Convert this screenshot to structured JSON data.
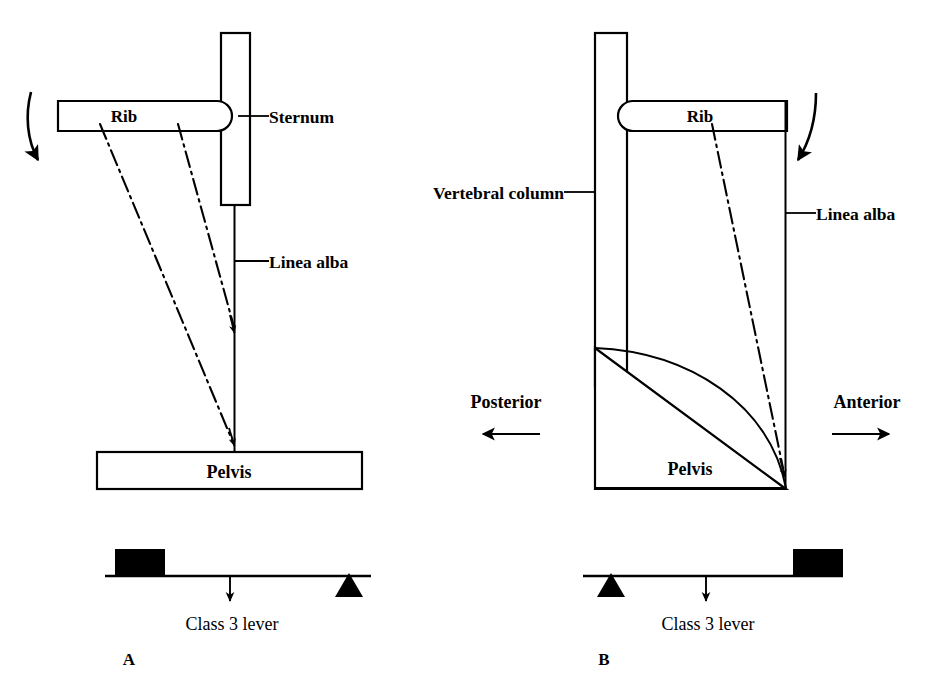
{
  "figure": {
    "kind": "anatomical-lever-diagram",
    "background_color": "#ffffff",
    "ink_color": "#000000"
  },
  "panel_a": {
    "panel_letter": "A",
    "rib_label": "Rib",
    "sternum_label": "Sternum",
    "linea_alba_label": "Linea alba",
    "pelvis_label": "Pelvis",
    "lever_label": "Class 3 lever",
    "lever_class": "Class 3",
    "rotation_arrow": "curved-down-arrow-left",
    "muscle_line_count": 2,
    "lever_effort_position": "left",
    "lever_fulcrum_position": "right",
    "lever_load_position": "center"
  },
  "panel_b": {
    "panel_letter": "B",
    "rib_label": "Rib",
    "vertebral_column_label": "Vertebral column",
    "linea_alba_label": "Linea alba",
    "pelvis_label": "Pelvis",
    "lever_label": "Class 3 lever",
    "lever_class": "Class 3",
    "posterior_label": "Posterior",
    "anterior_label": "Anterior",
    "rotation_arrow": "curved-down-arrow-right",
    "muscle_line_count": 1,
    "lever_effort_position": "right",
    "lever_fulcrum_position": "left",
    "lever_load_position": "center"
  }
}
